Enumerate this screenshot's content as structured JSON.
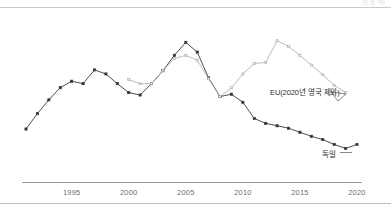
{
  "figure": {
    "unit_note": "(단위: %)",
    "background": "#ffffff",
    "axis_color": "#9a9a9a",
    "top_rule_color": "#c9c9c9"
  },
  "labels": {
    "eu": "EU(2020년 영국 제외)",
    "germany": "독일"
  },
  "chart_data": {
    "type": "line",
    "title": "",
    "xlabel": "",
    "ylabel": "",
    "grid": false,
    "legend": "inline-annotation",
    "xlim": [
      1991,
      2020
    ],
    "ylim": [
      0,
      10
    ],
    "xticks": [
      1995,
      2000,
      2005,
      2010,
      2015,
      2020
    ],
    "xticklabels": [
      "1995",
      "2000",
      "2005",
      "2010",
      "2015",
      "2020"
    ],
    "series": [
      {
        "name": "독일",
        "color": "#3a3a3a",
        "marker": "square",
        "x": [
          1991,
          1992,
          1993,
          1994,
          1995,
          1996,
          1997,
          1998,
          1999,
          2000,
          2001,
          2002,
          2003,
          2004,
          2005,
          2006,
          2007,
          2008,
          2009,
          2010,
          2011,
          2012,
          2013,
          2014,
          2015,
          2016,
          2017,
          2018,
          2019,
          2020
        ],
        "y": [
          2.9,
          3.85,
          4.7,
          5.45,
          5.85,
          5.7,
          6.55,
          6.3,
          5.7,
          5.15,
          5.0,
          5.7,
          6.5,
          7.45,
          8.25,
          7.65,
          6.05,
          4.9,
          5.05,
          4.55,
          3.55,
          3.25,
          3.1,
          2.95,
          2.7,
          2.45,
          2.25,
          1.95,
          1.7,
          1.95
        ]
      },
      {
        "name": "EU(2020년 영국 제외)",
        "color": "#a9a9a9",
        "marker": "square",
        "x": [
          2000,
          2001,
          2002,
          2003,
          2004,
          2005,
          2006,
          2007,
          2008,
          2009,
          2010,
          2011,
          2012,
          2013,
          2014,
          2015,
          2016,
          2017,
          2018,
          2019
        ],
        "y": [
          5.95,
          5.7,
          5.7,
          6.5,
          7.25,
          7.45,
          7.15,
          6.0,
          4.9,
          5.45,
          6.3,
          6.95,
          7.0,
          8.35,
          8.0,
          7.45,
          6.85,
          6.25,
          5.6,
          5.15
        ]
      }
    ]
  }
}
